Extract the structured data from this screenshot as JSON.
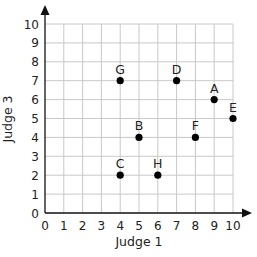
{
  "chart_data": {
    "type": "scatter",
    "title": "",
    "xlabel": "Judge 1",
    "ylabel": "Judge 3",
    "xlim": [
      0,
      10
    ],
    "ylim": [
      0,
      10
    ],
    "grid": true,
    "legend": null,
    "x_ticks": [
      "0",
      "1",
      "2",
      "3",
      "4",
      "5",
      "6",
      "7",
      "8",
      "9",
      "10"
    ],
    "y_ticks": [
      "0",
      "1",
      "2",
      "3",
      "4",
      "5",
      "6",
      "7",
      "8",
      "9",
      "10"
    ],
    "points": [
      {
        "label": "A",
        "x": 9,
        "y": 6
      },
      {
        "label": "B",
        "x": 5,
        "y": 4
      },
      {
        "label": "C",
        "x": 4,
        "y": 2
      },
      {
        "label": "D",
        "x": 7,
        "y": 7
      },
      {
        "label": "E",
        "x": 10,
        "y": 5
      },
      {
        "label": "F",
        "x": 8,
        "y": 4
      },
      {
        "label": "G",
        "x": 4,
        "y": 7
      },
      {
        "label": "H",
        "x": 6,
        "y": 2
      }
    ]
  },
  "colors": {
    "grid": "#c8c8c8",
    "axis": "#111111",
    "point": "#000000",
    "text": "#222222"
  }
}
